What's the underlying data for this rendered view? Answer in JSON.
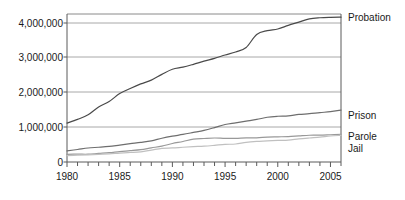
{
  "chart_data": {
    "type": "line",
    "title": "",
    "subtitle": "",
    "xlabel": "",
    "ylabel": "",
    "xlim": [
      1980,
      2006
    ],
    "ylim": [
      0,
      4300000
    ],
    "grid": true,
    "grid_axis": "y",
    "legend_position": "right-inline",
    "ytick_labels": [
      "0",
      "1,000,000",
      "2,000,000",
      "3,000,000",
      "4,000,000"
    ],
    "ytick_values": [
      0,
      1000000,
      2000000,
      3000000,
      4000000
    ],
    "xtick_labels": [
      "1980",
      "1985",
      "1990",
      "1995",
      "2000",
      "2005"
    ],
    "xtick_values": [
      1980,
      1985,
      1990,
      1995,
      2000,
      2005
    ],
    "xtick_minor_values": [
      1980,
      1981,
      1982,
      1983,
      1984,
      1985,
      1986,
      1987,
      1988,
      1989,
      1990,
      1991,
      1992,
      1993,
      1994,
      1995,
      1996,
      1997,
      1998,
      1999,
      2000,
      2001,
      2002,
      2003,
      2004,
      2005,
      2006
    ],
    "x": [
      1980,
      1981,
      1982,
      1983,
      1984,
      1985,
      1986,
      1987,
      1988,
      1989,
      1990,
      1991,
      1992,
      1993,
      1994,
      1995,
      1996,
      1997,
      1998,
      1999,
      2000,
      2001,
      2002,
      2003,
      2004,
      2005,
      2006
    ],
    "series": [
      {
        "name": "Probation",
        "color": "#4a4a4a",
        "values": [
          1118097,
          1225934,
          1357264,
          1582947,
          1740948,
          1968712,
          2114621,
          2247158,
          2356483,
          2522125,
          2670234,
          2729322,
          2811611,
          2903061,
          2981022,
          3077861,
          3164996,
          3296513,
          3670441,
          3779922,
          3826209,
          3931731,
          4024067,
          4120012,
          4151125,
          4162536,
          4166757
        ]
      },
      {
        "name": "Prison",
        "color": "#6e6e6e",
        "values": [
          319598,
          360029,
          402914,
          423898,
          448264,
          487593,
          526436,
          562814,
          607766,
          683367,
          743382,
          792535,
          850566,
          909381,
          990147,
          1078542,
          1127528,
          1176564,
          1224469,
          1287172,
          1316333,
          1330007,
          1367856,
          1390279,
          1421345,
          1448344,
          1492973
        ]
      },
      {
        "name": "Parole",
        "color": "#999999",
        "values": [
          220438,
          225539,
          224604,
          246440,
          266992,
          300203,
          325638,
          355505,
          407977,
          456803,
          531407,
          590442,
          658601,
          676100,
          690371,
          679421,
          679733,
          694787,
          696385,
          714457,
          723898,
          732333,
          750934,
          769925,
          771852,
          784408,
          798202
        ]
      },
      {
        "name": "Jail",
        "color": "#c0c0c0",
        "values": [
          182288,
          195085,
          207853,
          221815,
          233018,
          254986,
          272735,
          294092,
          341893,
          393303,
          405320,
          424129,
          441781,
          455500,
          479800,
          507044,
          518492,
          567079,
          592462,
          605943,
          621149,
          631240,
          665475,
          691301,
          713990,
          747529,
          766010
        ]
      }
    ]
  },
  "legend": {
    "items": [
      {
        "label": "Probation"
      },
      {
        "label": "Prison"
      },
      {
        "label": "Parole"
      },
      {
        "label": "Jail"
      }
    ]
  },
  "axes": {
    "y_labels": [
      {
        "text": "4,000,000"
      },
      {
        "text": "3,000,000"
      },
      {
        "text": "2,000,000"
      },
      {
        "text": "1,000,000"
      },
      {
        "text": "0"
      }
    ],
    "x_labels": [
      {
        "text": "1980"
      },
      {
        "text": "1985"
      },
      {
        "text": "1990"
      },
      {
        "text": "1995"
      },
      {
        "text": "2000"
      },
      {
        "text": "2005"
      }
    ]
  },
  "colors": {
    "background": "#ffffff",
    "frame": "#8a8a8a",
    "gridline": "#a8a8a8",
    "text": "#1a1a1a"
  }
}
